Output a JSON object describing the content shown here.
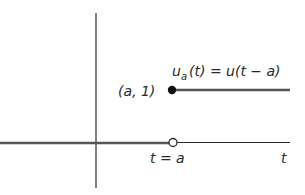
{
  "diagram": {
    "function_label": {
      "u": "u",
      "sub": "a",
      "rest": "(t) = u(t − a)"
    },
    "point_label": "(a, 1)",
    "step_label": "t = a",
    "axis_label": "t",
    "colors": {
      "axis": "#2a2a2a",
      "step_line": "#555555",
      "background": "#ffffff"
    },
    "elements": {
      "filled_point": {
        "label": "(a, 1)",
        "meaning": "u_a(a) = 1"
      },
      "open_point": {
        "label": "t = a",
        "meaning": "excluded value at 0"
      }
    }
  }
}
